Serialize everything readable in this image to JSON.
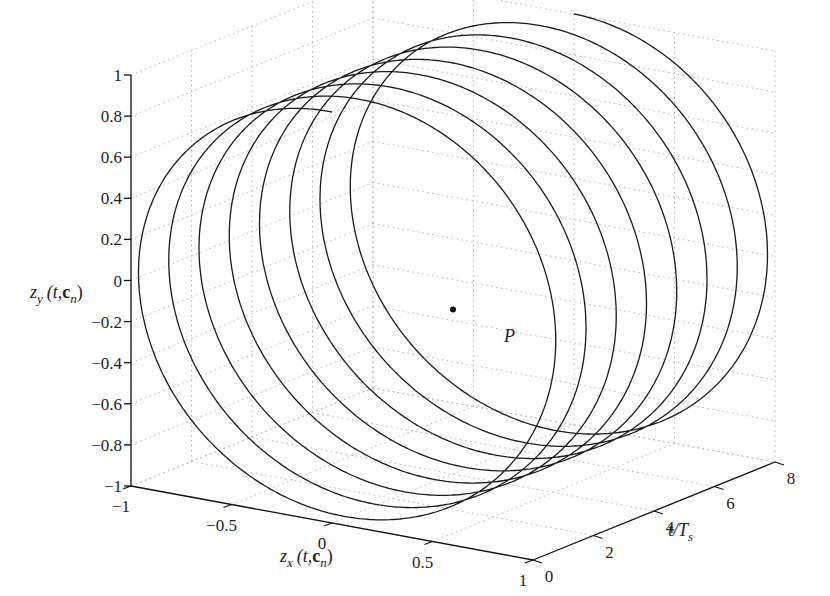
{
  "chart_data": {
    "type": "line3d",
    "title": "",
    "xlabel": "z_x (t, c_n)",
    "ylabel": "t / T_s",
    "zlabel": "z_y (t, c_n)",
    "xlim": [
      -1,
      1
    ],
    "ylim": [
      0,
      8
    ],
    "zlim": [
      -1,
      1
    ],
    "grid": true,
    "x_ticks": [
      "-1",
      "-0.5",
      "0",
      "0.5",
      "1"
    ],
    "y_ticks": [
      "0",
      "2",
      "4",
      "6",
      "8"
    ],
    "z_ticks": [
      "1",
      "0.8",
      "0.6",
      "0.4",
      "0.2",
      "0",
      "-0.2",
      "-0.4",
      "-0.6",
      "-0.8",
      "-1"
    ],
    "series": [
      {
        "name": "trajectory",
        "description": "unit-circle trajectory (z_x, z_y) advancing along t/T_s from 0 to 8, approx. one turn per sample period, shown as 8 overlapping loops",
        "loops": 8,
        "radius": 1
      }
    ],
    "annotations": [
      {
        "label": "P",
        "marker": "dot",
        "approx": {
          "z_x": 0.0,
          "z_y": -0.2,
          "t_over_Ts": 4.0
        }
      }
    ]
  },
  "labels": {
    "zlabel_main": "z",
    "zlabel_sub": "y",
    "zlabel_args": "(t,",
    "zlabel_bold": "c",
    "zlabel_boldsub": "n",
    "zlabel_close": ")",
    "xlabel_main": "z",
    "xlabel_sub": "x",
    "xlabel_args": "(t,",
    "xlabel_bold": "c",
    "xlabel_boldsub": "n",
    "xlabel_close": ")",
    "ylabel_main": "t/T",
    "ylabel_sub": "s",
    "point_label": "P"
  }
}
